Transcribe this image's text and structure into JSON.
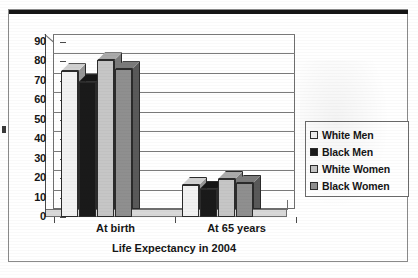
{
  "chart_data": {
    "type": "bar",
    "title": "",
    "xlabel": "Life Expectancy in 2004",
    "ylabel": "",
    "categories": [
      "At birth",
      "At 65 years"
    ],
    "series": [
      {
        "name": "White Men",
        "values": [
          75.0,
          16.5
        ],
        "color": "#f2f2f2"
      },
      {
        "name": "Black Men",
        "values": [
          69.5,
          14.5
        ],
        "color": "#1a1a1a"
      },
      {
        "name": "White Women",
        "values": [
          80.5,
          19.5
        ],
        "color": "#c6c6c6"
      },
      {
        "name": "Black Women",
        "values": [
          76.0,
          17.5
        ],
        "color": "#8f8f8f"
      }
    ],
    "ylim": [
      0,
      90
    ],
    "yticks": [
      0,
      10,
      20,
      30,
      40,
      50,
      60,
      70,
      80,
      90
    ],
    "grid": true,
    "legend_position": "right",
    "three_d": true
  },
  "legend": {
    "items": [
      {
        "label": "White Men"
      },
      {
        "label": "Black Men"
      },
      {
        "label": "White Women"
      },
      {
        "label": "Black Women"
      }
    ]
  },
  "axis": {
    "x_title": "Life Expectancy in 2004",
    "category_labels": [
      "At birth",
      "At 65 years"
    ],
    "y_tick_labels": [
      "90",
      "80",
      "70",
      "60",
      "50",
      "40",
      "30",
      "20",
      "10",
      "0"
    ]
  }
}
